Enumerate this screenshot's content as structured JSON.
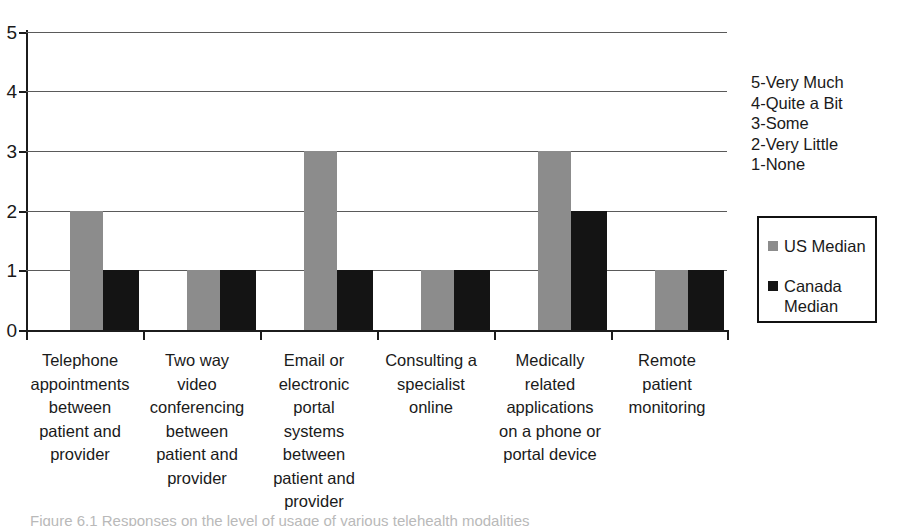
{
  "chart_data": {
    "type": "bar",
    "title": "",
    "xlabel": "",
    "ylabel": "",
    "ylim": [
      0,
      5
    ],
    "yticks": [
      0,
      1,
      2,
      3,
      4,
      5
    ],
    "grid": true,
    "legend_position": "right",
    "categories": [
      "Telephone appointments between patient and provider",
      "Two way video conferencing between patient and provider",
      "Email or electronic portal systems between patient and provider",
      "Consulting a specialist online",
      "Medically related applications on a phone or portal device",
      "Remote patient monitoring"
    ],
    "category_lines": [
      [
        "Telephone",
        "appointments",
        "between",
        "patient and",
        "provider"
      ],
      [
        "Two way",
        "video",
        "conferencing",
        "between",
        "patient and",
        "provider"
      ],
      [
        "Email or",
        "electronic",
        "portal",
        "systems",
        "between",
        "patient and",
        "provider"
      ],
      [
        "Consulting a",
        "specialist",
        "online"
      ],
      [
        "Medically",
        "related",
        "applications",
        "on a phone or",
        "portal device"
      ],
      [
        "Remote",
        "patient",
        "monitoring"
      ]
    ],
    "series": [
      {
        "name": "US Median",
        "color": "#8c8c8c",
        "values": [
          2,
          1,
          3,
          1,
          3,
          1
        ]
      },
      {
        "name": "Canada Median",
        "color": "#141414",
        "values": [
          1,
          1,
          1,
          1,
          2,
          1
        ]
      }
    ],
    "scale_key": [
      "5-Very Much",
      "4-Quite a Bit",
      "3-Some",
      "2-Very Little",
      "1-None"
    ]
  },
  "legend": {
    "items": [
      {
        "label": "US Median",
        "label_line1": "US Median",
        "label_line2": "",
        "color": "#8c8c8c"
      },
      {
        "label": "Canada Median",
        "label_line1": "Canada",
        "label_line2": "Median",
        "color": "#141414"
      }
    ]
  },
  "axis": {
    "y_tick_labels": [
      "0",
      "1",
      "2",
      "3",
      "4",
      "5"
    ]
  },
  "caption": {
    "text": "Figure 6.1 Responses on the level of usage of various telehealth modalities"
  },
  "colors": {
    "us_bar": "#8c8c8c",
    "canada_bar": "#141414",
    "axis": "#1c1c1c",
    "gridline": "#5a5a5a",
    "text": "#1a1a1a",
    "background": "#ffffff"
  }
}
